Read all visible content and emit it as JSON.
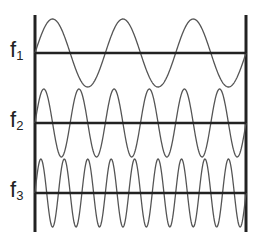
{
  "diagram": {
    "line_color": "#222222",
    "wave_color": "#555555",
    "waves": [
      {
        "label": "f",
        "subscript": "1",
        "cycles": 3
      },
      {
        "label": "f",
        "subscript": "2",
        "cycles": 6
      },
      {
        "label": "f",
        "subscript": "3",
        "cycles": 9
      }
    ]
  }
}
